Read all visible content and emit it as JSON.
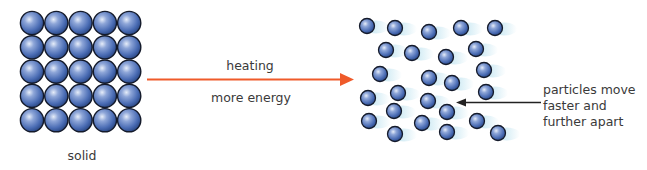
{
  "solid": {
    "label": "solid",
    "grid": {
      "rows": 5,
      "cols": 5,
      "x0": 32,
      "y0": 23,
      "spacing": 24.3,
      "radius": 11.6
    }
  },
  "transition": {
    "top_label": "heating",
    "bottom_label": "more energy",
    "arrow_color": "#ef5a2a"
  },
  "gas": {
    "particles": [
      [
        367,
        26
      ],
      [
        395,
        28
      ],
      [
        429,
        32
      ],
      [
        461,
        28
      ],
      [
        495,
        28
      ],
      [
        386,
        50
      ],
      [
        412,
        53
      ],
      [
        446,
        57
      ],
      [
        476,
        49
      ],
      [
        380,
        74
      ],
      [
        429,
        78
      ],
      [
        452,
        83
      ],
      [
        484,
        70
      ],
      [
        398,
        93
      ],
      [
        368,
        98
      ],
      [
        428,
        101
      ],
      [
        486,
        92
      ],
      [
        394,
        111
      ],
      [
        447,
        112
      ],
      [
        369,
        121
      ],
      [
        422,
        123
      ],
      [
        477,
        121
      ],
      [
        395,
        134
      ],
      [
        447,
        132
      ],
      [
        498,
        133
      ]
    ],
    "radius": 7.5,
    "annotation": {
      "lines": [
        "particles move",
        "faster and",
        "further apart"
      ]
    }
  },
  "colors": {
    "particle_light": "#dfe7f7",
    "particle_mid": "#5677bf",
    "particle_dark": "#26437f",
    "outline": "#141a2a",
    "motion_trail": "#aedcec",
    "text": "#3a3a3a"
  }
}
